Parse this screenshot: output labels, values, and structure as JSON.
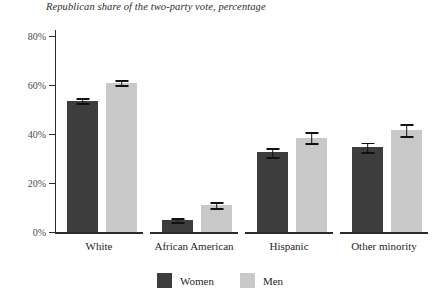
{
  "chart_data": {
    "type": "bar",
    "title": "Republican share of the two-party vote, percentage",
    "xlabel": "",
    "ylabel": "",
    "ylim": [
      0,
      80
    ],
    "yticks": [
      0,
      20,
      40,
      60,
      80
    ],
    "ytick_labels": [
      "0%",
      "20%",
      "40%",
      "60%",
      "80%"
    ],
    "grid": false,
    "legend_position": "bottom-center",
    "categories": [
      "White",
      "African American",
      "Hispanic",
      "Other minority"
    ],
    "series": [
      {
        "name": "Women",
        "color": "#3d3d3d",
        "values": [
          53.5,
          5.0,
          32.5,
          34.5
        ],
        "errors": [
          1.0,
          0.8,
          1.8,
          2.0
        ]
      },
      {
        "name": "Men",
        "color": "#c9c9c9",
        "values": [
          61.0,
          11.0,
          38.5,
          41.5
        ],
        "errors": [
          1.0,
          1.2,
          2.2,
          2.5
        ]
      }
    ]
  },
  "legend": {
    "items": [
      {
        "label": "Women",
        "color": "#3d3d3d"
      },
      {
        "label": "Men",
        "color": "#c9c9c9"
      }
    ]
  },
  "axis": {
    "tick_labels": [
      "80%",
      "60%",
      "40%",
      "20%",
      "0%"
    ]
  }
}
